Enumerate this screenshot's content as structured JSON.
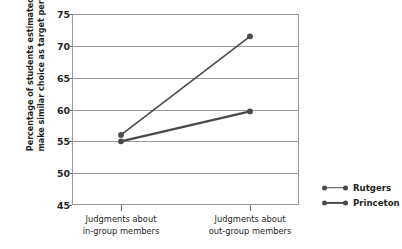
{
  "chart_data": {
    "type": "line",
    "title": "",
    "xlabel": "",
    "ylabel_line1": "Percentage of students estimated to",
    "ylabel_line2": "make similar choice as target person",
    "categories": [
      {
        "line1": "Judgments about",
        "line2": "in-group members"
      },
      {
        "line1": "Judgments about",
        "line2": "out-group members"
      }
    ],
    "series": [
      {
        "name": "Rutgers",
        "values": [
          56.0,
          71.5
        ],
        "color": "#4a4a4a",
        "line_width": 1.6
      },
      {
        "name": "Princeton",
        "values": [
          55.0,
          59.7
        ],
        "color": "#4a4a4a",
        "line_width": 2.2
      }
    ],
    "ylim": [
      45,
      75
    ],
    "yticks": [
      75,
      70,
      65,
      60,
      55,
      50,
      45
    ],
    "grid": true,
    "legend_position": "right"
  },
  "legend": {
    "items": [
      {
        "label": "Rutgers"
      },
      {
        "label": "Princeton"
      }
    ]
  },
  "colors": {
    "series": "#4a4a4a",
    "grid": "#9a9a9a",
    "frame": "#9a9a9a",
    "text": "#231f20",
    "background": "#ffffff"
  }
}
